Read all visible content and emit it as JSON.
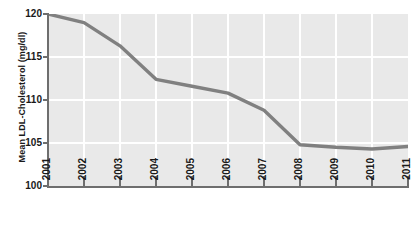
{
  "chart_data": {
    "type": "line",
    "title": "",
    "subtitle": "",
    "xlabel": "",
    "ylabel": "Mean LDL-Cholesterol (mg/dl)",
    "categories": [
      "2001",
      "2002",
      "2003",
      "2004",
      "2005",
      "2006",
      "2007",
      "2008",
      "2009",
      "2010",
      "2011"
    ],
    "x": [
      2001,
      2002,
      2003,
      2004,
      2005,
      2006,
      2007,
      2008,
      2009,
      2010,
      2011
    ],
    "values": [
      120.0,
      119.0,
      116.3,
      112.4,
      111.6,
      110.8,
      108.8,
      104.8,
      104.5,
      104.3,
      104.6
    ],
    "series": [
      {
        "name": "Mean LDL-Cholesterol",
        "values": [
          120.0,
          119.0,
          116.3,
          112.4,
          111.6,
          110.8,
          108.8,
          104.8,
          104.5,
          104.3,
          104.6
        ],
        "color": "#808080"
      }
    ],
    "ylim": [
      100,
      120
    ],
    "xlim": [
      2001,
      2011
    ],
    "yticks": [
      100,
      105,
      110,
      115,
      120
    ],
    "ytick_labels": [
      "100",
      "105",
      "110",
      "115",
      "120"
    ],
    "xticks": [
      2001,
      2002,
      2003,
      2004,
      2005,
      2006,
      2007,
      2008,
      2009,
      2010,
      2011
    ],
    "grid": true,
    "grid_color": "#ffffff",
    "plot_background": "#e9e9e9",
    "legend": false,
    "legend_position": "none",
    "line_width": 3,
    "xtick_label_rotation": -90,
    "annotations": []
  },
  "axes": {
    "y_title": "Mean LDL-Cholesterol (mg/dl)",
    "y_tick_labels": [
      "120",
      "115",
      "110",
      "105",
      "100"
    ],
    "x_tick_labels": [
      "2001",
      "2002",
      "2003",
      "2004",
      "2005",
      "2006",
      "2007",
      "2008",
      "2009",
      "2010",
      "2011"
    ]
  },
  "colors": {
    "series_line": "#808080",
    "plot_background": "#e9e9e9",
    "gridline": "#ffffff",
    "axis": "#6e6e6e",
    "text": "#1a1a1a"
  }
}
